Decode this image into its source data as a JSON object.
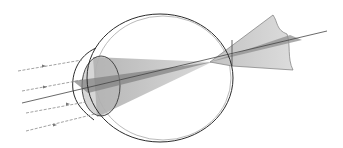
{
  "diagram": {
    "colors": {
      "background": "#ffffff",
      "outline": "#2b2b2b",
      "faint_outline": "#9a9a9a",
      "cone_fill": "#c9c9c9",
      "lens_fill": "#b8b8b8",
      "wedge_fill": "#8c8c8c",
      "ray": "#8a8a8a"
    },
    "rays": [
      {
        "x1": 18,
        "y1": 71,
        "x2": 82,
        "y2": 60
      },
      {
        "x1": 22,
        "y1": 91,
        "x2": 82,
        "y2": 80
      },
      {
        "x1": 22,
        "y1": 103,
        "x2": 82,
        "y2": 92
      },
      {
        "x1": 26,
        "y1": 113,
        "x2": 86,
        "y2": 102
      },
      {
        "x1": 26,
        "y1": 131,
        "x2": 95,
        "y2": 114
      }
    ]
  }
}
